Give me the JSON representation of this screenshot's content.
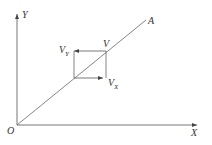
{
  "diagram": {
    "type": "vector-decomposition",
    "colors": {
      "line": "#555555",
      "text": "#333333",
      "background": "#ffffff"
    },
    "axes": {
      "origin_label": "O",
      "x_label": "X",
      "y_label": "Y"
    },
    "line_label": "A",
    "vector": {
      "label": "V",
      "x_component": {
        "base": "V",
        "sub": "X"
      },
      "y_component": {
        "base": "V",
        "sub": "Y"
      }
    }
  }
}
